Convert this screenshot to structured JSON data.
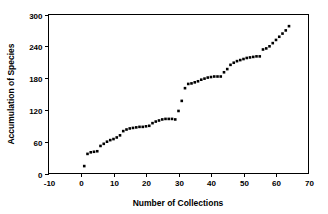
{
  "chart_data": {
    "type": "scatter",
    "title": "",
    "xlabel": "Number of Collections",
    "ylabel": "Accumulation of Species",
    "xlim": [
      -10,
      70
    ],
    "ylim": [
      0,
      300
    ],
    "xticks": [
      -10,
      0,
      10,
      20,
      30,
      40,
      50,
      60,
      70
    ],
    "yticks": [
      0,
      60,
      120,
      180,
      240,
      300
    ],
    "grid": false,
    "legend": null,
    "marker": "square",
    "marker_color": "#000000",
    "series": [
      {
        "name": "Species accumulation",
        "x": [
          1,
          2,
          3,
          4,
          5,
          6,
          7,
          8,
          9,
          10,
          11,
          12,
          13,
          14,
          15,
          16,
          17,
          18,
          19,
          20,
          21,
          22,
          23,
          24,
          25,
          26,
          27,
          28,
          29,
          30,
          31,
          32,
          33,
          34,
          35,
          36,
          37,
          38,
          39,
          40,
          41,
          42,
          43,
          44,
          45,
          46,
          47,
          48,
          49,
          50,
          51,
          52,
          53,
          54,
          55,
          56,
          57,
          58,
          59,
          60,
          61,
          62,
          63,
          64
        ],
        "y": [
          14,
          37,
          40,
          41,
          42,
          52,
          56,
          60,
          63,
          65,
          68,
          72,
          80,
          83,
          85,
          86,
          87,
          88,
          88,
          89,
          90,
          95,
          98,
          100,
          102,
          103,
          103,
          103,
          102,
          118,
          137,
          161,
          169,
          170,
          172,
          174,
          177,
          179,
          181,
          182,
          183,
          183,
          183,
          191,
          197,
          205,
          209,
          212,
          214,
          216,
          218,
          219,
          220,
          221,
          221,
          234,
          236,
          240,
          246,
          252,
          258,
          264,
          270,
          278
        ]
      }
    ]
  },
  "axis": {
    "x_tick_labels": [
      "-10",
      "0",
      "10",
      "20",
      "30",
      "40",
      "50",
      "60",
      "70"
    ],
    "y_tick_labels": [
      "0",
      "60",
      "120",
      "180",
      "240",
      "300"
    ],
    "x_title": "Number of Collections",
    "y_title": "Accumulation of Species"
  }
}
